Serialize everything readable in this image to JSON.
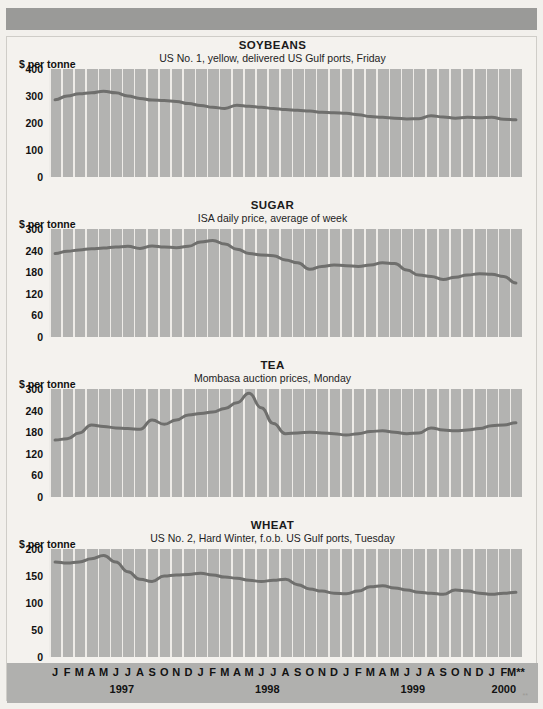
{
  "page": {
    "background_color": "#f2f0ec",
    "banner_color": "#9a9a98",
    "plot_background_color": "#b3b3b1",
    "gridline_color": "#eeece8",
    "line_color": "#6f6f6d",
    "axis_band_color": "#b0b0ae"
  },
  "axis": {
    "unit_label": "$ per tonne",
    "months": [
      "J",
      "F",
      "M",
      "A",
      "M",
      "J",
      "J",
      "A",
      "S",
      "O",
      "N",
      "D"
    ],
    "final_month_marker": "**",
    "years": [
      "1997",
      "1998",
      "1999",
      "2000"
    ],
    "last_year_months": [
      "J",
      "F",
      "M"
    ],
    "footnote": "**"
  },
  "chart_data": [
    {
      "type": "line",
      "title": "SOYBEANS",
      "subtitle": "US No. 1, yellow, delivered US Gulf ports, Friday",
      "ylabel": "$ per tonne",
      "xlabel": "",
      "ylim": [
        0,
        400
      ],
      "yticks": [
        0,
        100,
        200,
        300,
        400
      ],
      "grid": true,
      "legend": "none",
      "x": [
        "1997-01",
        "1997-02",
        "1997-03",
        "1997-04",
        "1997-05",
        "1997-06",
        "1997-07",
        "1997-08",
        "1997-09",
        "1997-10",
        "1997-11",
        "1997-12",
        "1998-01",
        "1998-02",
        "1998-03",
        "1998-04",
        "1998-05",
        "1998-06",
        "1998-07",
        "1998-08",
        "1998-09",
        "1998-10",
        "1998-11",
        "1998-12",
        "1999-01",
        "1999-02",
        "1999-03",
        "1999-04",
        "1999-05",
        "1999-06",
        "1999-07",
        "1999-08",
        "1999-09",
        "1999-10",
        "1999-11",
        "1999-12",
        "2000-01",
        "2000-02",
        "2000-03"
      ],
      "values": [
        286,
        300,
        308,
        312,
        318,
        312,
        300,
        291,
        285,
        283,
        280,
        272,
        265,
        258,
        254,
        266,
        262,
        258,
        254,
        250,
        247,
        244,
        240,
        238,
        236,
        231,
        224,
        221,
        218,
        215,
        216,
        227,
        222,
        218,
        221,
        219,
        221,
        214,
        212
      ]
    },
    {
      "type": "line",
      "title": "SUGAR",
      "subtitle": "ISA daily price, average of week",
      "ylabel": "$ per tonne",
      "xlabel": "",
      "ylim": [
        0,
        300
      ],
      "yticks": [
        0,
        60,
        120,
        180,
        240,
        300
      ],
      "grid": true,
      "legend": "none",
      "x": [
        "1997-01",
        "1997-02",
        "1997-03",
        "1997-04",
        "1997-05",
        "1997-06",
        "1997-07",
        "1997-08",
        "1997-09",
        "1997-10",
        "1997-11",
        "1997-12",
        "1998-01",
        "1998-02",
        "1998-03",
        "1998-04",
        "1998-05",
        "1998-06",
        "1998-07",
        "1998-08",
        "1998-09",
        "1998-10",
        "1998-11",
        "1998-12",
        "1999-01",
        "1999-02",
        "1999-03",
        "1999-04",
        "1999-05",
        "1999-06",
        "1999-07",
        "1999-08",
        "1999-09",
        "1999-10",
        "1999-11",
        "1999-12",
        "2000-01",
        "2000-02",
        "2000-03"
      ],
      "values": [
        232,
        238,
        242,
        245,
        247,
        250,
        252,
        246,
        253,
        250,
        248,
        252,
        264,
        268,
        258,
        244,
        232,
        228,
        226,
        214,
        206,
        188,
        196,
        200,
        198,
        196,
        200,
        206,
        204,
        186,
        172,
        168,
        160,
        166,
        172,
        176,
        174,
        168,
        150
      ]
    },
    {
      "type": "line",
      "title": "TEA",
      "subtitle": "Mombasa auction prices, Monday",
      "ylabel": "$ per tonne",
      "xlabel": "",
      "ylim": [
        0,
        300
      ],
      "yticks": [
        0,
        60,
        120,
        180,
        240,
        300
      ],
      "grid": true,
      "legend": "none",
      "x": [
        "1997-01",
        "1997-02",
        "1997-03",
        "1997-04",
        "1997-05",
        "1997-06",
        "1997-07",
        "1997-08",
        "1997-09",
        "1997-10",
        "1997-11",
        "1997-12",
        "1998-01",
        "1998-02",
        "1998-03",
        "1998-04",
        "1998-05",
        "1998-06",
        "1998-07",
        "1998-08",
        "1998-09",
        "1998-10",
        "1998-11",
        "1998-12",
        "1999-01",
        "1999-02",
        "1999-03",
        "1999-04",
        "1999-05",
        "1999-06",
        "1999-07",
        "1999-08",
        "1999-09",
        "1999-10",
        "1999-11",
        "1999-12",
        "2000-01",
        "2000-02",
        "2000-03"
      ],
      "values": [
        158,
        162,
        178,
        200,
        196,
        192,
        190,
        188,
        214,
        202,
        214,
        228,
        232,
        236,
        246,
        262,
        288,
        248,
        204,
        176,
        178,
        180,
        178,
        176,
        172,
        176,
        182,
        184,
        180,
        176,
        178,
        192,
        186,
        184,
        186,
        190,
        198,
        200,
        206
      ]
    },
    {
      "type": "line",
      "title": "WHEAT",
      "subtitle": "US No. 2, Hard Winter, f.o.b. US Gulf ports, Tuesday",
      "ylabel": "$ per tonne",
      "xlabel": "",
      "ylim": [
        0,
        200
      ],
      "yticks": [
        0,
        50,
        100,
        150,
        200
      ],
      "grid": true,
      "legend": "none",
      "x": [
        "1997-01",
        "1997-02",
        "1997-03",
        "1997-04",
        "1997-05",
        "1997-06",
        "1997-07",
        "1997-08",
        "1997-09",
        "1997-10",
        "1997-11",
        "1997-12",
        "1998-01",
        "1998-02",
        "1998-03",
        "1998-04",
        "1998-05",
        "1998-06",
        "1998-07",
        "1998-08",
        "1998-09",
        "1998-10",
        "1998-11",
        "1998-12",
        "1999-01",
        "1999-02",
        "1999-03",
        "1999-04",
        "1999-05",
        "1999-06",
        "1999-07",
        "1999-08",
        "1999-09",
        "1999-10",
        "1999-11",
        "1999-12",
        "2000-01",
        "2000-02",
        "2000-03"
      ],
      "values": [
        176,
        174,
        176,
        182,
        188,
        176,
        158,
        144,
        140,
        150,
        152,
        153,
        155,
        152,
        148,
        146,
        142,
        140,
        142,
        144,
        134,
        126,
        122,
        118,
        117,
        122,
        130,
        132,
        128,
        124,
        120,
        118,
        116,
        124,
        122,
        118,
        116,
        118,
        120
      ]
    }
  ]
}
